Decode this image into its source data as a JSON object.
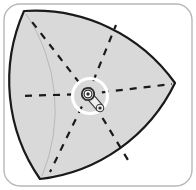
{
  "figure": {
    "type": "technical-illustration",
    "canvas": {
      "width": 196,
      "height": 190
    },
    "colors": {
      "background": "#ffffff",
      "frame_border": "#b8b8b8",
      "rotor_fill": "#d9d9d9",
      "rotor_stroke": "#1a1a1a",
      "dashed_line": "#1a1a1a",
      "highlight_ring": "#ffffff",
      "pivot_body": "#f2f2f2",
      "pivot_stroke": "#3a3a3a",
      "hub_dark": "#2b2b2b"
    }
  },
  "frame": {
    "name": "rounded-panel",
    "x": 4,
    "y": 4,
    "width": 188,
    "height": 182,
    "corner_radius": 16,
    "stroke_width": 1.4
  },
  "rotor": {
    "name": "reuleaux-triangle",
    "shape": "Reuleaux triangle",
    "vertices": [
      {
        "label": "top-left",
        "x": 24,
        "y": 11
      },
      {
        "label": "right",
        "x": 175,
        "y": 83
      },
      {
        "label": "bottom-left",
        "x": 40,
        "y": 179
      }
    ],
    "arc_radius": 172,
    "stroke_width": 2.2,
    "fill": "#d9d9d9"
  },
  "pivot": {
    "name": "center-pivot-linkage",
    "center": {
      "x": 88,
      "y": 94
    },
    "hub_outer_radius": 6.2,
    "hub_inner_radius": 2.4,
    "arm": {
      "from": {
        "x": 88,
        "y": 94
      },
      "to": {
        "x": 100,
        "y": 108
      },
      "width": 7.5,
      "end_pin_radius": 1.6
    }
  },
  "highlight": {
    "name": "white-highlight-ring",
    "center": {
      "x": 90,
      "y": 96
    },
    "radius": 17.5,
    "stroke_width": 3.2
  },
  "dashed_rays": {
    "name": "radial-dashed-construction-lines",
    "count": 6,
    "origin": {
      "x": 88,
      "y": 94
    },
    "dash_pattern": "7 7",
    "stroke_width": 2.2,
    "rays": [
      {
        "label": "ray-west",
        "angle_deg": 180,
        "end": {
          "x": 19,
          "y": 96
        }
      },
      {
        "label": "ray-east",
        "angle_deg": 0,
        "end": {
          "x": 172,
          "y": 84
        }
      },
      {
        "label": "ray-northwest",
        "angle_deg": 232,
        "end": {
          "x": 29,
          "y": 18
        }
      },
      {
        "label": "ray-northeast",
        "angle_deg": 300,
        "end": {
          "x": 116,
          "y": 25
        }
      },
      {
        "label": "ray-southwest",
        "angle_deg": 128,
        "end": {
          "x": 50,
          "y": 172
        }
      },
      {
        "label": "ray-southeast",
        "angle_deg": 60,
        "end": {
          "x": 128,
          "y": 160
        }
      }
    ]
  },
  "labels": {
    "figure_alt": "Reuleaux triangle rotor with dashed radial lines converging on a highlighted central pivot linkage"
  }
}
